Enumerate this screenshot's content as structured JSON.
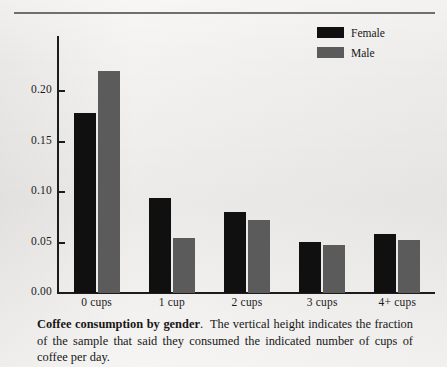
{
  "figure": {
    "background_color": "#f1f0ee",
    "rule_color": "#6f6f6f"
  },
  "legend": {
    "position": "top-right",
    "entries": [
      {
        "label": "Female",
        "color": "#101010"
      },
      {
        "label": "Male",
        "color": "#5b5b5b"
      }
    ]
  },
  "caption": {
    "title": "Coffee consumption by gender",
    "period": ".",
    "body": "The vertical height indicates the fraction of the sample that said they consumed the indicated number of cups of coffee per day."
  },
  "axis": {
    "y_ticks": [
      "0.00",
      "0.05",
      "0.10",
      "0.15",
      "0.20"
    ],
    "x_ticks": [
      "0 cups",
      "1 cup",
      "2 cups",
      "3 cups",
      "4+ cups"
    ]
  },
  "chart_data": {
    "type": "bar",
    "title": "Coffee consumption by gender",
    "xlabel": "",
    "ylabel": "",
    "categories": [
      "0 cups",
      "1 cup",
      "2 cups",
      "3 cups",
      "4+ cups"
    ],
    "series": [
      {
        "name": "Female",
        "color": "#101010",
        "values": [
          0.178,
          0.094,
          0.08,
          0.051,
          0.058
        ]
      },
      {
        "name": "Male",
        "color": "#5b5b5b",
        "values": [
          0.22,
          0.055,
          0.072,
          0.048,
          0.053
        ]
      }
    ],
    "ylim": [
      0.0,
      0.23
    ],
    "ytick_values": [
      0.0,
      0.05,
      0.1,
      0.15,
      0.2
    ],
    "ytick_labels": [
      "0.00",
      "0.05",
      "0.10",
      "0.15",
      "0.20"
    ],
    "grid": false,
    "legend_position": "top right",
    "annotations": []
  }
}
